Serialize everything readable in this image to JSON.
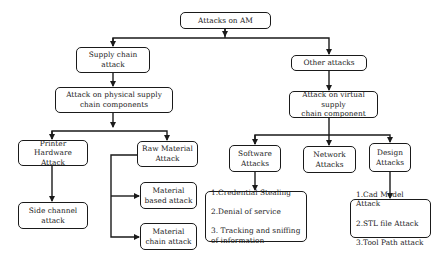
{
  "diagram": {
    "title": "Attacks on AM",
    "nodes": {
      "root": {
        "label": "Attacks on AM"
      },
      "supply_chain": {
        "label": "Supply chain\nattack"
      },
      "other": {
        "label": "Other attacks"
      },
      "physical": {
        "label": "Attack on physical supply\nchain components"
      },
      "virtual": {
        "label": "Attack on virtual supply\nchain component"
      },
      "printer_hw": {
        "label": "Printer\nHardware Attack"
      },
      "raw_material": {
        "label": "Raw Material\nAttack"
      },
      "side_channel": {
        "label": "Side channel\nattack"
      },
      "material_based": {
        "label": "Material\nbased attack"
      },
      "material_chain": {
        "label": "Material\nchain attack"
      },
      "software": {
        "label": "Software\nAttacks"
      },
      "network": {
        "label": "Network\nAttacks"
      },
      "design": {
        "label": "Design\nAttacks"
      },
      "software_list": {
        "items": [
          "1.Credential Stealing",
          "2.Denial of service",
          "3. Tracking and sniffing of information"
        ]
      },
      "design_list": {
        "items": [
          "1.Cad Model Attack",
          "2.STL file Attack",
          "3.Tool Path attack"
        ]
      }
    },
    "edges": [
      [
        "Attacks on AM",
        "Supply chain attack"
      ],
      [
        "Attacks on AM",
        "Other attacks"
      ],
      [
        "Supply chain attack",
        "Attack on physical supply chain components"
      ],
      [
        "Other attacks",
        "Attack on virtual supply chain component"
      ],
      [
        "Attack on physical supply chain components",
        "Printer Hardware Attack"
      ],
      [
        "Attack on physical supply chain components",
        "Raw Material Attack"
      ],
      [
        "Printer Hardware Attack",
        "Side channel attack"
      ],
      [
        "Raw Material Attack",
        "Material based attack"
      ],
      [
        "Raw Material Attack",
        "Material chain attack"
      ],
      [
        "Attack on virtual supply chain component",
        "Software Attacks"
      ],
      [
        "Attack on virtual supply chain component",
        "Network Attacks"
      ],
      [
        "Attack on virtual supply chain component",
        "Design Attacks"
      ],
      [
        "Software Attacks",
        "Software attack list"
      ],
      [
        "Design Attacks",
        "Design attack list"
      ]
    ]
  }
}
